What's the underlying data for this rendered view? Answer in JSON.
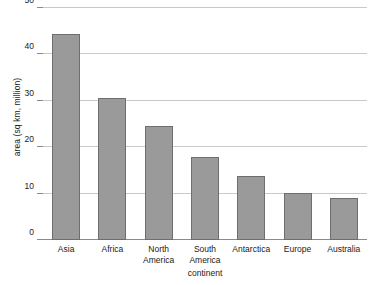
{
  "chart_data": {
    "type": "bar",
    "title": "",
    "subtitle": "",
    "xlabel": "continent",
    "ylabel": "area (sq km, million)",
    "categories": [
      "Asia",
      "Africa",
      "North America",
      "South America",
      "Antarctica",
      "Europe",
      "Australia"
    ],
    "values": [
      44.4,
      30.6,
      24.5,
      17.8,
      13.7,
      10.1,
      9.1
    ],
    "ylim": [
      0,
      50
    ],
    "yticks": [
      0,
      10,
      20,
      30,
      40,
      50
    ],
    "ytick_labels": [
      "0",
      "10",
      "20",
      "30",
      "40",
      "50"
    ],
    "grid": "horizontal",
    "legend": "none",
    "series": [
      {
        "name": "area",
        "values": [
          44.4,
          30.6,
          24.5,
          17.8,
          13.7,
          10.1,
          9.1
        ]
      }
    ],
    "colors": {
      "bar_fill": "#9a9a9a",
      "bar_stroke": "#6e6e6e",
      "gridline": "#c9c9c9",
      "axis": "#8a8a8a",
      "text": "#1a1a1a",
      "background": "#ffffff"
    }
  }
}
